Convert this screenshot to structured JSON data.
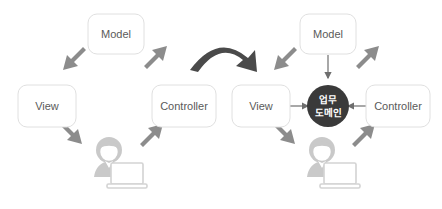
{
  "diagram": {
    "colors": {
      "box_fill": "#ffffff",
      "box_stroke": "#e0e0e0",
      "label_text": "#5a5a5a",
      "thick_arrow": "#8c8c8c",
      "thin_line": "#6e6e6e",
      "transition_arrow": "#4a4a4a",
      "domain_circle": "#3a3a3a",
      "domain_text": "#ffffff",
      "person": "#c9c9c9",
      "background": "#ffffff"
    },
    "left_panel": {
      "name": "classic-mvc",
      "nodes": [
        {
          "id": "model",
          "label": "Model"
        },
        {
          "id": "view",
          "label": "View"
        },
        {
          "id": "controller",
          "label": "Controller"
        },
        {
          "id": "user",
          "label": ""
        }
      ],
      "arrows": [
        {
          "from": "model",
          "to": "view",
          "style": "thick"
        },
        {
          "from": "view",
          "to": "user",
          "style": "thick"
        },
        {
          "from": "user",
          "to": "controller",
          "style": "thick"
        },
        {
          "from": "controller",
          "to": "model",
          "style": "thick"
        }
      ]
    },
    "transition_arrow": {
      "label": "",
      "direction": "left-to-right",
      "style": "curved"
    },
    "right_panel": {
      "name": "mvc-with-business-domain",
      "nodes": [
        {
          "id": "model",
          "label": "Model"
        },
        {
          "id": "view",
          "label": "View"
        },
        {
          "id": "controller",
          "label": "Controller"
        },
        {
          "id": "domain",
          "label_line1": "업무",
          "label_line2": "도메인"
        },
        {
          "id": "user",
          "label": ""
        }
      ],
      "arrows": [
        {
          "from": "model",
          "to": "view",
          "style": "thick"
        },
        {
          "from": "view",
          "to": "user",
          "style": "thick"
        },
        {
          "from": "user",
          "to": "controller",
          "style": "thick"
        },
        {
          "from": "controller",
          "to": "model",
          "style": "thick"
        },
        {
          "from": "model",
          "to": "domain",
          "style": "thin"
        },
        {
          "from": "view",
          "to": "domain",
          "style": "thin"
        },
        {
          "from": "controller",
          "to": "domain",
          "style": "thin"
        }
      ]
    }
  }
}
